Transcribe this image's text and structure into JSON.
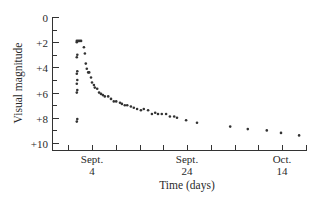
{
  "chart_data": {
    "type": "scatter",
    "title": "",
    "xlabel": "Time (days)",
    "ylabel": "Visual magnitude",
    "y_inverted": true,
    "ylim": [
      0,
      10
    ],
    "y_ticks": [
      {
        "value": 0,
        "label": "0"
      },
      {
        "value": 2,
        "label": "+2"
      },
      {
        "value": 4,
        "label": "+4"
      },
      {
        "value": 6,
        "label": "+6"
      },
      {
        "value": 8,
        "label": "+8"
      },
      {
        "value": 10,
        "label": "+10"
      }
    ],
    "y_minor_ticks": [
      1,
      3,
      5,
      7,
      9
    ],
    "x_unit": "days since Aug 31 (day 4 = Sept. 4, day 24 = Sept. 24, day 44 = Oct. 14)",
    "xlim": [
      -1,
      49
    ],
    "x_ticks_every_days": 5,
    "x_tick_positions": [
      -1,
      4,
      9,
      14,
      19,
      24,
      29,
      34,
      39,
      44,
      49
    ],
    "x_labels": [
      {
        "value": 4,
        "line1": "Sept.",
        "line2": "4"
      },
      {
        "value": 24,
        "line1": "Sept.",
        "line2": "24"
      },
      {
        "value": 44,
        "line1": "Oct.",
        "line2": "14"
      }
    ],
    "grid": false,
    "legend": null,
    "points": [
      [
        0.8,
        1.9
      ],
      [
        0.8,
        2.0
      ],
      [
        0.9,
        3.0
      ],
      [
        0.8,
        3.2
      ],
      [
        0.9,
        4.3
      ],
      [
        0.8,
        4.5
      ],
      [
        0.9,
        5.0
      ],
      [
        0.8,
        5.3
      ],
      [
        0.9,
        5.8
      ],
      [
        0.8,
        6.0
      ],
      [
        0.9,
        8.1
      ],
      [
        0.8,
        8.3
      ],
      [
        1.1,
        1.9
      ],
      [
        1.4,
        1.9
      ],
      [
        1.7,
        1.9
      ],
      [
        2.3,
        2.4
      ],
      [
        2.5,
        2.9
      ],
      [
        2.7,
        3.7
      ],
      [
        2.9,
        4.1
      ],
      [
        3.2,
        4.4
      ],
      [
        3.4,
        4.4
      ],
      [
        3.8,
        4.8
      ],
      [
        4.0,
        5.2
      ],
      [
        4.4,
        5.4
      ],
      [
        4.6,
        5.6
      ],
      [
        5.1,
        5.7
      ],
      [
        5.5,
        6.0
      ],
      [
        5.9,
        6.1
      ],
      [
        6.3,
        6.2
      ],
      [
        6.7,
        6.3
      ],
      [
        7.4,
        6.3
      ],
      [
        8.0,
        6.5
      ],
      [
        8.6,
        6.7
      ],
      [
        9.1,
        6.7
      ],
      [
        9.9,
        6.8
      ],
      [
        10.3,
        6.9
      ],
      [
        10.9,
        7.0
      ],
      [
        11.4,
        7.0
      ],
      [
        12.2,
        7.1
      ],
      [
        12.8,
        7.2
      ],
      [
        13.5,
        7.3
      ],
      [
        14.3,
        7.4
      ],
      [
        14.9,
        7.3
      ],
      [
        15.8,
        7.4
      ],
      [
        16.6,
        7.7
      ],
      [
        17.3,
        7.6
      ],
      [
        17.9,
        7.7
      ],
      [
        18.7,
        7.7
      ],
      [
        19.6,
        7.7
      ],
      [
        20.4,
        7.9
      ],
      [
        21.3,
        7.9
      ],
      [
        21.9,
        8.0
      ],
      [
        23.8,
        8.2
      ],
      [
        26.1,
        8.4
      ],
      [
        33.1,
        8.7
      ],
      [
        36.8,
        8.9
      ],
      [
        40.8,
        9.0
      ],
      [
        43.8,
        9.2
      ],
      [
        47.6,
        9.4
      ]
    ]
  },
  "colors": {
    "background": "#ffffff",
    "axis": "#333333",
    "points": "#333333",
    "text": "#2a2a2a"
  }
}
